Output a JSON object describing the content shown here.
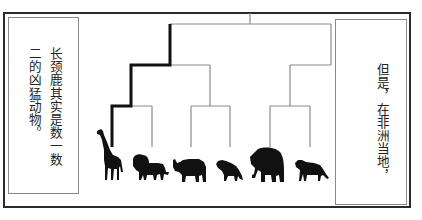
{
  "panel": {
    "caption_left": {
      "lines": [
        "长颈鹿其实是数一数",
        "二的凶猛动物。"
      ]
    },
    "caption_right": {
      "lines": [
        "但是，在非洲当地，"
      ]
    }
  },
  "tree": {
    "highlighted_path_color": "#111111",
    "branch_color": "#8a8a8a",
    "leaves": [
      {
        "name": "giraffe",
        "highlighted": true
      },
      {
        "name": "lion",
        "highlighted": false
      },
      {
        "name": "rhinoceros",
        "highlighted": false
      },
      {
        "name": "hyena",
        "highlighted": false
      },
      {
        "name": "elephant",
        "highlighted": false
      },
      {
        "name": "cheetah",
        "highlighted": false
      }
    ]
  }
}
